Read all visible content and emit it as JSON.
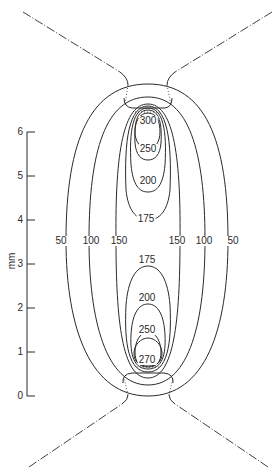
{
  "figure": {
    "axis": {
      "unit_label": "mm",
      "ticks": [
        "0",
        "1",
        "2",
        "3",
        "4",
        "5",
        "6"
      ]
    },
    "contour_labels": {
      "upper": {
        "c300": "300",
        "c250": "250",
        "c200": "200",
        "c175": "175"
      },
      "lower": {
        "c175": "175",
        "c200": "200",
        "c250": "250",
        "c270": "270"
      },
      "left": {
        "c50": "50",
        "c100": "100",
        "c150": "150"
      },
      "right": {
        "c150": "150",
        "c100": "100",
        "c50": "50"
      }
    },
    "line_color": "#2a2a2a",
    "background": "#ffffff"
  }
}
